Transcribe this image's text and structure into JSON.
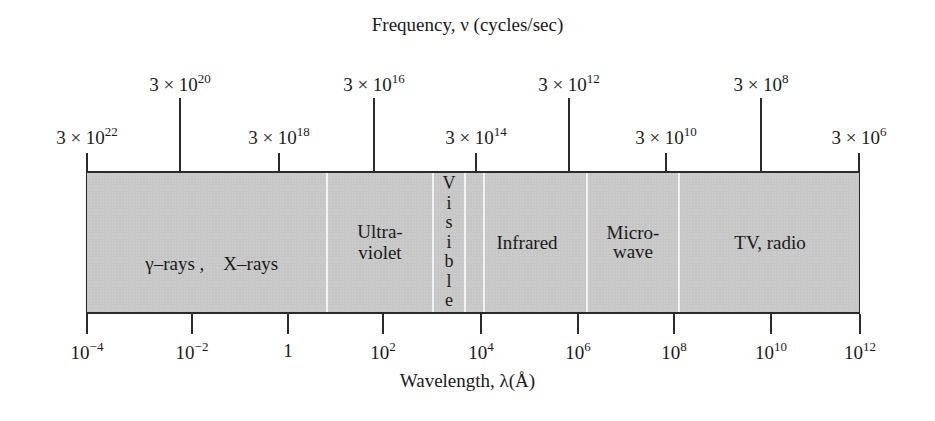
{
  "title": "Frequency, ν (cycles/sec)",
  "xlabel": "Wavelength, λ(Å)",
  "colors": {
    "band_fill": "#c7c7c7",
    "line": "#2a2a2a",
    "divider": "#f2f2f2",
    "background": "#ffffff"
  },
  "frequency_axis": {
    "ticks": [
      {
        "label_base": "3 × 10",
        "exponent": "22",
        "x": 87,
        "tier": "low"
      },
      {
        "label_base": "3 × 10",
        "exponent": "20",
        "x": 180,
        "tier": "high"
      },
      {
        "label_base": "3 × 10",
        "exponent": "18",
        "x": 279,
        "tier": "low"
      },
      {
        "label_base": "3 × 10",
        "exponent": "16",
        "x": 374,
        "tier": "high"
      },
      {
        "label_base": "3 × 10",
        "exponent": "14",
        "x": 476,
        "tier": "low"
      },
      {
        "label_base": "3 × 10",
        "exponent": "12",
        "x": 569,
        "tier": "high"
      },
      {
        "label_base": "3 × 10",
        "exponent": "10",
        "x": 666,
        "tier": "low"
      },
      {
        "label_base": "3 × 10",
        "exponent": "8",
        "x": 761,
        "tier": "high"
      },
      {
        "label_base": "3 × 10",
        "exponent": "6",
        "x": 859,
        "tier": "low"
      }
    ]
  },
  "wavelength_axis": {
    "ticks": [
      {
        "label_base": "10",
        "exponent": "−4",
        "x": 87
      },
      {
        "label_base": "10",
        "exponent": "−2",
        "x": 192
      },
      {
        "label_base": "1",
        "exponent": "",
        "x": 288
      },
      {
        "label_base": "10",
        "exponent": "2",
        "x": 383
      },
      {
        "label_base": "10",
        "exponent": "4",
        "x": 481
      },
      {
        "label_base": "10",
        "exponent": "6",
        "x": 578
      },
      {
        "label_base": "10",
        "exponent": "8",
        "x": 674
      },
      {
        "label_base": "10",
        "exponent": "10",
        "x": 771
      },
      {
        "label_base": "10",
        "exponent": "12",
        "x": 860
      }
    ]
  },
  "bands": [
    {
      "name": "gamma-x-rays",
      "label": "γ–rays ,    X–rays",
      "center_x": 207
    },
    {
      "name": "ultraviolet",
      "label_line1": "Ultra-",
      "label_line2": "violet",
      "center_x": 380
    },
    {
      "name": "visible",
      "letters": [
        "V",
        "i",
        "s",
        "i",
        "b",
        "l",
        "e"
      ],
      "center_x": 449
    },
    {
      "name": "infrared",
      "label": "Infrared",
      "center_x": 527
    },
    {
      "name": "microwave",
      "label_line1": "Micro-",
      "label_line2": "wave",
      "center_x": 633
    },
    {
      "name": "tv-radio",
      "label": "TV, radio",
      "center_x": 770
    }
  ],
  "dividers_x": [
    327,
    433,
    465,
    484,
    587,
    679
  ],
  "chart_data": {
    "type": "table",
    "title": "Frequency, ν (cycles/sec)",
    "xlabel": "Wavelength, λ(Å)",
    "scale": "log10",
    "wavelength_ticks_angstrom": [
      "1e-4",
      "1e-2",
      "1",
      "1e2",
      "1e4",
      "1e6",
      "1e8",
      "1e10",
      "1e12"
    ],
    "frequency_ticks_hz": [
      "3e22",
      "3e20",
      "3e18",
      "3e16",
      "3e14",
      "3e12",
      "3e10",
      "3e8",
      "3e6"
    ],
    "wavelength_range_log10": [
      -4,
      12
    ],
    "bands": [
      {
        "label": "γ-rays, X-rays",
        "wavelength_log10_range": [
          -4,
          1.2
        ]
      },
      {
        "label": "Ultraviolet",
        "wavelength_log10_range": [
          1.2,
          3.4
        ]
      },
      {
        "label": "Visible",
        "wavelength_log10_range": [
          3.4,
          4.0
        ]
      },
      {
        "label": "Infrared",
        "wavelength_log10_range": [
          4.0,
          6.2
        ]
      },
      {
        "label": "Microwave",
        "wavelength_log10_range": [
          6.2,
          8.2
        ]
      },
      {
        "label": "TV, radio",
        "wavelength_log10_range": [
          8.2,
          12
        ]
      }
    ]
  }
}
